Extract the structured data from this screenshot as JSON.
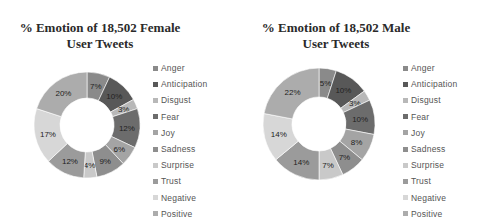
{
  "chart_data": [
    {
      "type": "pie",
      "subtype": "donut",
      "title": "% Emotion of 18,502 Female User Tweets",
      "title_lines": [
        "% Emotion of 18,502 Female",
        "User  Tweets"
      ],
      "categories": [
        "Anger",
        "Anticipation",
        "Disgust",
        "Fear",
        "Joy",
        "Sadness",
        "Surprise",
        "Trust",
        "Negative",
        "Positive"
      ],
      "values": [
        7,
        10,
        3,
        12,
        6,
        9,
        4,
        12,
        17,
        20
      ],
      "labels": [
        "7%",
        "10%",
        "3%",
        "12%",
        "6%",
        "9%",
        "4%",
        "12%",
        "17%",
        "20%"
      ],
      "legend_position": "right"
    },
    {
      "type": "pie",
      "subtype": "donut",
      "title": "% Emotion of 18,502 Male User Tweets",
      "title_lines": [
        "% Emotion of 18,502 Male",
        "User  Tweets"
      ],
      "categories": [
        "Anger",
        "Anticipation",
        "Disgust",
        "Fear",
        "Joy",
        "Sadness",
        "Surprise",
        "Trust",
        "Negative",
        "Positive"
      ],
      "values": [
        5,
        10,
        3,
        10,
        8,
        7,
        7,
        14,
        14,
        22
      ],
      "labels": [
        "5%",
        "10%",
        "3%",
        "10%",
        "8%",
        "7%",
        "7%",
        "14%",
        "14%",
        "22%"
      ],
      "legend_position": "right"
    }
  ],
  "colors": {
    "Anger": "#8a8a8a",
    "Anticipation": "#585858",
    "Disgust": "#b8b8b8",
    "Fear": "#6c6c6c",
    "Joy": "#a4a4a4",
    "Sadness": "#8e8e8e",
    "Surprise": "#c9c9c9",
    "Trust": "#9b9b9b",
    "Negative": "#d7d7d7",
    "Positive": "#acacac"
  }
}
